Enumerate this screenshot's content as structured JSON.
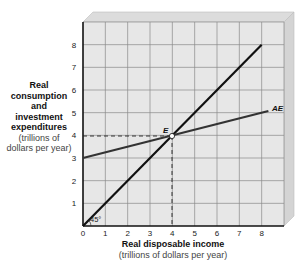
{
  "chart_data": {
    "type": "line",
    "title": "",
    "xlabel": "Real disposable income",
    "xlabel_sub": "(trillions of dollars per year)",
    "ylabel_lines": [
      "Real",
      "consumption",
      "and",
      "investment",
      "expenditures"
    ],
    "ylabel_sub_lines": [
      "(trillions of",
      "dollars per year)"
    ],
    "xlim": [
      0,
      9
    ],
    "ylim": [
      0,
      9
    ],
    "x_ticks": [
      "0",
      "1",
      "2",
      "3",
      "4",
      "5",
      "6",
      "7",
      "8"
    ],
    "y_ticks": [
      "1",
      "2",
      "3",
      "4",
      "5",
      "6",
      "7",
      "8"
    ],
    "grid": true,
    "series": [
      {
        "name": "45-degree line",
        "label": "45°",
        "x": [
          0,
          8
        ],
        "y": [
          0,
          8
        ],
        "color": "#111111"
      },
      {
        "name": "AE",
        "label": "AE",
        "x": [
          0,
          8.3
        ],
        "y": [
          3,
          5.075
        ],
        "color": "#333333"
      }
    ],
    "annotations": [
      {
        "label": "E",
        "x": 4,
        "y": 4,
        "type": "point",
        "dashed_guides_to_axes": true
      }
    ]
  },
  "labels": {
    "e_point": "E",
    "ae_line": "AE",
    "angle": "45°"
  },
  "colors": {
    "face": "#e7e7e7",
    "side": "#d6d6d6",
    "top": "#dcdcdc",
    "grid": "#8a8a8a",
    "axis": "#111111"
  }
}
